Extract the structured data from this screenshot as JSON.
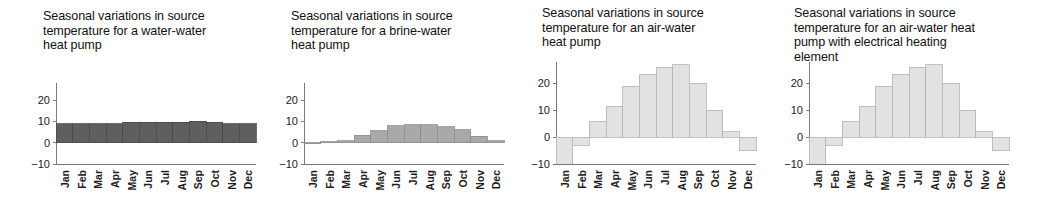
{
  "figure": {
    "name": "seasonal-source-temperature-panels",
    "panel_count": 4,
    "background_color": "#ffffff"
  },
  "panels": [
    {
      "id": "water-water",
      "title": "Seasonal variations in source\ntemperature for a water-water\nheat pump",
      "bar_color": "#5f5f5f",
      "bar_edge_color": "#4a4a4a"
    },
    {
      "id": "brine-water",
      "title": "Seasonal variations in source\ntemperature for a brine-water\nheat pump",
      "bar_color": "#a9a9a9",
      "bar_edge_color": "#8d8d8d"
    },
    {
      "id": "air-water",
      "title": "Seasonal variations in source\ntemperature for an air-water\nheat pump",
      "bar_color": "#e2e2e2",
      "bar_edge_color": "#b4b4b4"
    },
    {
      "id": "air-water-electrical",
      "title": "Seasonal variations in source\ntemperature for an air-water heat\npump with electrical heating\nelement",
      "bar_color": "#e2e2e2",
      "bar_edge_color": "#b4b4b4"
    }
  ],
  "axis": {
    "y_ticks": [
      20,
      10,
      0,
      -10
    ],
    "y_tick_labels": [
      "20",
      "10",
      "0",
      "−10"
    ],
    "ylim": [
      -10,
      28
    ],
    "x_tick_labels": [
      "Jan",
      "Feb",
      "Mar",
      "Apr",
      "May",
      "Jun",
      "Jul",
      "Aug",
      "Sep",
      "Oct",
      "Nov",
      "Dec"
    ]
  },
  "chart_data": [
    {
      "type": "bar",
      "title": "Seasonal variations in source temperature for a water-water heat pump",
      "xlabel": "",
      "ylabel": "",
      "categories": [
        "Jan",
        "Feb",
        "Mar",
        "Apr",
        "May",
        "Jun",
        "Jul",
        "Aug",
        "Sep",
        "Oct",
        "Nov",
        "Dec"
      ],
      "values": [
        9,
        9,
        9,
        9,
        9.5,
        9.5,
        9.5,
        9.5,
        10,
        9.5,
        9,
        9
      ],
      "ylim": [
        -10,
        28
      ],
      "yticks": [
        -10,
        0,
        10,
        20
      ],
      "grid": false,
      "legend": "none",
      "bar_color": "#5f5f5f"
    },
    {
      "type": "bar",
      "title": "Seasonal variations in source temperature for a brine-water heat pump",
      "xlabel": "",
      "ylabel": "",
      "categories": [
        "Jan",
        "Feb",
        "Mar",
        "Apr",
        "May",
        "Jun",
        "Jul",
        "Aug",
        "Sep",
        "Oct",
        "Nov",
        "Dec"
      ],
      "values": [
        0,
        0.5,
        1,
        3.5,
        5.5,
        8,
        8.5,
        8.5,
        7.5,
        6,
        3,
        1
      ],
      "ylim": [
        -10,
        28
      ],
      "yticks": [
        -10,
        0,
        10,
        20
      ],
      "grid": false,
      "legend": "none",
      "bar_color": "#a9a9a9"
    },
    {
      "type": "bar",
      "title": "Seasonal variations in source temperature for an air-water heat pump",
      "xlabel": "",
      "ylabel": "",
      "categories": [
        "Jan",
        "Feb",
        "Mar",
        "Apr",
        "May",
        "Jun",
        "Jul",
        "Aug",
        "Sep",
        "Oct",
        "Nov",
        "Dec"
      ],
      "values": [
        -10,
        -3,
        6,
        11.5,
        19,
        23.5,
        26,
        27,
        20,
        10,
        2,
        -5
      ],
      "ylim": [
        -10,
        28
      ],
      "yticks": [
        -10,
        0,
        10,
        20
      ],
      "grid": false,
      "legend": "none",
      "bar_color": "#e2e2e2"
    },
    {
      "type": "bar",
      "title": "Seasonal variations in source temperature for an air-water heat pump with electrical heating element",
      "xlabel": "",
      "ylabel": "",
      "categories": [
        "Jan",
        "Feb",
        "Mar",
        "Apr",
        "May",
        "Jun",
        "Jul",
        "Aug",
        "Sep",
        "Oct",
        "Nov",
        "Dec"
      ],
      "values": [
        -10,
        -3,
        6,
        11.5,
        19,
        23.5,
        26,
        27,
        20,
        10,
        2,
        -5
      ],
      "ylim": [
        -10,
        28
      ],
      "yticks": [
        -10,
        0,
        10,
        20
      ],
      "grid": false,
      "legend": "none",
      "bar_color": "#e2e2e2"
    }
  ]
}
